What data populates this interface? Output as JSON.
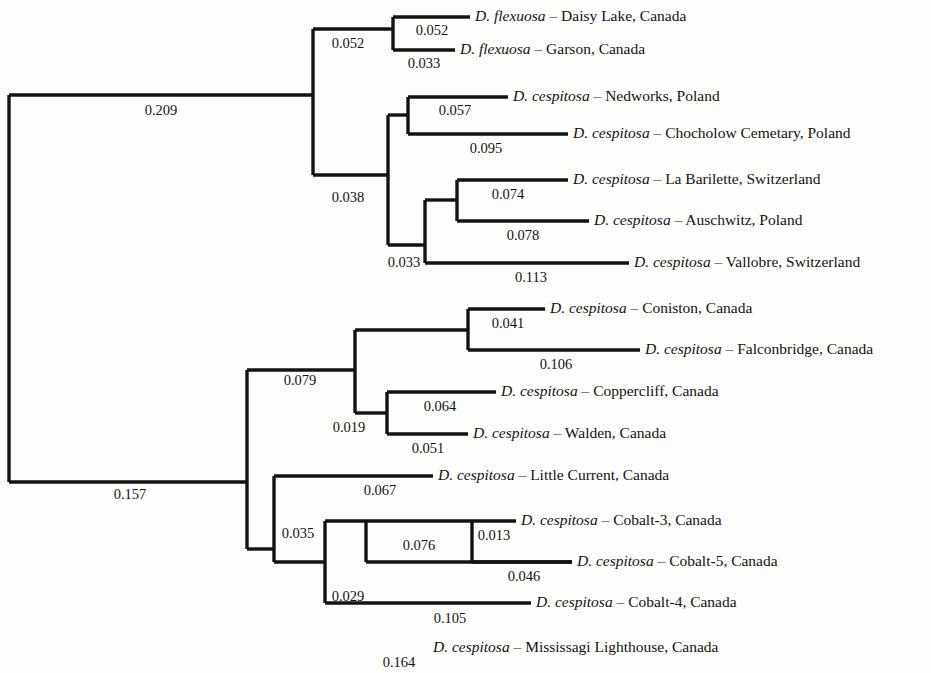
{
  "figure": {
    "name": "phylogenetic-tree",
    "type": "phylogram",
    "orientation": "left-to-right",
    "taxa_count": 16
  },
  "chart_data": {
    "type": "tree",
    "title": "",
    "xlabel": "",
    "ylabel": "",
    "grid": false,
    "legend": "none",
    "branch_length_unit": "substitutions per site",
    "tips": [
      {
        "id": "daisy-lake",
        "genus": "D.",
        "species": "flexuosa",
        "dash": "–",
        "locality": "Daisy Lake, Canada",
        "branch_length": "0.052",
        "y": 17,
        "x_start": 470,
        "x_end": 470
      },
      {
        "id": "garson",
        "genus": "D.",
        "species": "flexuosa",
        "dash": "–",
        "locality": "Garson, Canada",
        "branch_length": "0.033",
        "y": 50,
        "x_start": 455,
        "x_end": 455
      },
      {
        "id": "nedworks",
        "genus": "D.",
        "species": "cespitosa",
        "dash": "–",
        "locality": "Nedworks, Poland",
        "branch_length": "0.057",
        "y": 97,
        "x_start": 508,
        "x_end": 508
      },
      {
        "id": "chocholow-cemetary",
        "genus": "D.",
        "species": "cespitosa",
        "dash": "–",
        "locality": "Chocholow Cemetary, Poland",
        "branch_length": "0.095",
        "y": 134,
        "x_start": 568,
        "x_end": 568
      },
      {
        "id": "la-barilette",
        "genus": "D.",
        "species": "cespitosa",
        "dash": "–",
        "locality": "La Barilette, Switzerland",
        "branch_length": "0.074",
        "y": 180,
        "x_start": 568,
        "x_end": 568
      },
      {
        "id": "auschwitz",
        "genus": "D.",
        "species": "cespitosa",
        "dash": "–",
        "locality": "Auschwitz, Poland",
        "branch_length": "0.078",
        "y": 221,
        "x_start": 589,
        "x_end": 589
      },
      {
        "id": "vallobre",
        "genus": "D.",
        "species": "cespitosa",
        "dash": "–",
        "locality": "Vallobre, Switzerland",
        "branch_length": "0.113",
        "y": 263,
        "x_start": 629,
        "x_end": 629
      },
      {
        "id": "coniston",
        "genus": "D.",
        "species": "cespitosa",
        "dash": "–",
        "locality": "Coniston, Canada",
        "branch_length": "0.041",
        "y": 309,
        "x_start": 545,
        "x_end": 545
      },
      {
        "id": "falconbridge",
        "genus": "D.",
        "species": "cespitosa",
        "dash": "–",
        "locality": "Falconbridge, Canada",
        "branch_length": "0.106",
        "y": 350,
        "x_start": 640,
        "x_end": 640
      },
      {
        "id": "coppercliff",
        "genus": "D.",
        "species": "cespitosa",
        "dash": "–",
        "locality": "Coppercliff, Canada",
        "branch_length": "0.064",
        "y": 392,
        "x_start": 496,
        "x_end": 496
      },
      {
        "id": "walden",
        "genus": "D.",
        "species": "cespitosa",
        "dash": "–",
        "locality": "Walden, Canada",
        "branch_length": "0.051",
        "y": 434,
        "x_start": 468,
        "x_end": 468
      },
      {
        "id": "little-current",
        "genus": "D.",
        "species": "cespitosa",
        "dash": "–",
        "locality": "Little Current, Canada",
        "branch_length": "0.067",
        "y": 476,
        "x_start": 433,
        "x_end": 433
      },
      {
        "id": "cobalt-3",
        "genus": "D.",
        "species": "cespitosa",
        "dash": "–",
        "locality": "Cobalt-3, Canada",
        "branch_length": "0.013",
        "y": 521,
        "x_start": 516,
        "x_end": 516
      },
      {
        "id": "cobalt-5",
        "genus": "D.",
        "species": "cespitosa",
        "dash": "–",
        "locality": "Cobalt-5, Canada",
        "branch_length": "0.046",
        "y": 562,
        "x_start": 572,
        "x_end": 572
      },
      {
        "id": "cobalt-4",
        "genus": "D.",
        "species": "cespitosa",
        "dash": "–",
        "locality": "Cobalt-4, Canada",
        "branch_length": "0.105",
        "y": 603,
        "x_start": 531,
        "x_end": 531
      },
      {
        "id": "mississagi-lighthouse",
        "genus": "D.",
        "species": "cespitosa",
        "dash": "–",
        "locality": "Mississagi Lighthouse, Canada",
        "branch_length": "0.164",
        "y": 648,
        "x_start": 428,
        "x_end": 428
      }
    ],
    "internal_nodes": [
      {
        "id": "root",
        "branch_length": "",
        "x": 9,
        "y_top": 95,
        "y_bottom": 482
      },
      {
        "id": "node-eurasian-clade",
        "branch_length": "0.209",
        "x": 313,
        "y_top": 29,
        "y_bottom": 175
      },
      {
        "id": "node-flexuosa-pair",
        "branch_length": "0.052",
        "x": 393,
        "y_top": 17,
        "y_bottom": 50
      },
      {
        "id": "node-poland-swiss",
        "branch_length": "0.038",
        "x": 388,
        "y_top": 115,
        "y_bottom": 245
      },
      {
        "id": "node-nedworks-pair",
        "branch_length": "0.057",
        "x": 408,
        "y_top": 97,
        "y_bottom": 134
      },
      {
        "id": "node-alpine-clade",
        "branch_length": "0.033",
        "x": 425,
        "y_top": 200,
        "y_bottom": 263
      },
      {
        "id": "node-barilette-pair",
        "branch_length": "0.074",
        "x": 457,
        "y_top": 180,
        "y_bottom": 221
      },
      {
        "id": "node-canadian-clade",
        "branch_length": "0.157",
        "x": 247,
        "y_top": 370,
        "y_bottom": 549
      },
      {
        "id": "node-sudbury-clade",
        "branch_length": "0.079",
        "x": 355,
        "y_top": 330,
        "y_bottom": 413
      },
      {
        "id": "node-coniston-pair",
        "branch_length": "0.041",
        "x": 468,
        "y_top": 309,
        "y_bottom": 350
      },
      {
        "id": "node-coppercliff-pair",
        "branch_length": "0.064",
        "x": 387,
        "y_top": 392,
        "y_bottom": 434
      },
      {
        "id": "node-cobalt-clade",
        "branch_length": "0.035",
        "x": 274,
        "y_top": 476,
        "y_bottom": 562
      },
      {
        "id": "node-cobalt-inner",
        "branch_length": "0.029",
        "x": 325,
        "y_top": 521,
        "y_bottom": 603
      },
      {
        "id": "node-cobalt-pair-076",
        "branch_length": "0.076",
        "x": 366,
        "y_top": 521,
        "y_bottom": 562
      },
      {
        "id": "node-cobalt-35",
        "branch_length": "0.013",
        "x": 472,
        "y_top": 521,
        "y_bottom": 562
      }
    ],
    "branch_length_labels": [
      {
        "id": "bl-0209",
        "value": "0.209",
        "x": 161,
        "y": 112
      },
      {
        "id": "bl-0052-clade",
        "value": "0.052",
        "x": 348,
        "y": 45
      },
      {
        "id": "bl-0052-tip",
        "value": "0.052",
        "x": 432,
        "y": 32
      },
      {
        "id": "bl-0033-tip",
        "value": "0.033",
        "x": 424,
        "y": 65
      },
      {
        "id": "bl-0038",
        "value": "0.038",
        "x": 348,
        "y": 199
      },
      {
        "id": "bl-0057",
        "value": "0.057",
        "x": 455,
        "y": 112
      },
      {
        "id": "bl-0095",
        "value": "0.095",
        "x": 486,
        "y": 150
      },
      {
        "id": "bl-0033-alpine",
        "value": "0.033",
        "x": 404,
        "y": 264
      },
      {
        "id": "bl-0074",
        "value": "0.074",
        "x": 508,
        "y": 196
      },
      {
        "id": "bl-0078",
        "value": "0.078",
        "x": 523,
        "y": 237
      },
      {
        "id": "bl-0113",
        "value": "0.113",
        "x": 531,
        "y": 279
      },
      {
        "id": "bl-0157",
        "value": "0.157",
        "x": 130,
        "y": 496
      },
      {
        "id": "bl-0079",
        "value": "0.079",
        "x": 300,
        "y": 382
      },
      {
        "id": "bl-0019",
        "value": "0.019",
        "x": 349,
        "y": 429
      },
      {
        "id": "bl-0041",
        "value": "0.041",
        "x": 508,
        "y": 325
      },
      {
        "id": "bl-0106",
        "value": "0.106",
        "x": 556,
        "y": 366
      },
      {
        "id": "bl-0064",
        "value": "0.064",
        "x": 440,
        "y": 408
      },
      {
        "id": "bl-0051",
        "value": "0.051",
        "x": 428,
        "y": 450
      },
      {
        "id": "bl-0035",
        "value": "0.035",
        "x": 298,
        "y": 535
      },
      {
        "id": "bl-0067",
        "value": "0.067",
        "x": 380,
        "y": 492
      },
      {
        "id": "bl-0029",
        "value": "0.029",
        "x": 348,
        "y": 598
      },
      {
        "id": "bl-0076",
        "value": "0.076",
        "x": 419,
        "y": 547
      },
      {
        "id": "bl-0013",
        "value": "0.013",
        "x": 494,
        "y": 537
      },
      {
        "id": "bl-0046",
        "value": "0.046",
        "x": 524,
        "y": 578
      },
      {
        "id": "bl-0105",
        "value": "0.105",
        "x": 450,
        "y": 620
      },
      {
        "id": "bl-0164",
        "value": "0.164",
        "x": 399,
        "y": 664
      }
    ]
  }
}
